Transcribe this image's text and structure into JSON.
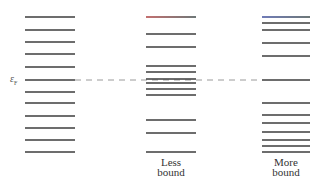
{
  "diagram": {
    "type": "energy-level-diagram",
    "fermi_label": {
      "symbol": "ε",
      "subscript": "F"
    },
    "fermi_level_y": 80,
    "columns": [
      {
        "name": "reference",
        "label_lines": [],
        "x_start": 25,
        "x_end": 75,
        "levels_y": [
          17,
          30,
          42,
          54,
          67,
          80,
          92,
          103,
          116,
          128,
          140,
          152
        ]
      },
      {
        "name": "less-bound",
        "label_lines": [
          "Less",
          "bound"
        ],
        "x_start": 146,
        "x_end": 196,
        "levels_y": [
          17,
          34,
          47,
          66,
          72,
          79,
          83,
          89,
          95,
          120,
          133,
          152
        ],
        "top_line_tint": "#b04040"
      },
      {
        "name": "more-bound",
        "label_lines": [
          "More",
          "bound"
        ],
        "x_start": 262,
        "x_end": 310,
        "levels_y": [
          17,
          23,
          30,
          43,
          56,
          80,
          103,
          115,
          123,
          132,
          140,
          146,
          152
        ],
        "top_line_tint": "#4050a0"
      }
    ],
    "dashed_line": {
      "x_start": 75,
      "x_end": 262,
      "color": "#9a9a9a"
    }
  }
}
